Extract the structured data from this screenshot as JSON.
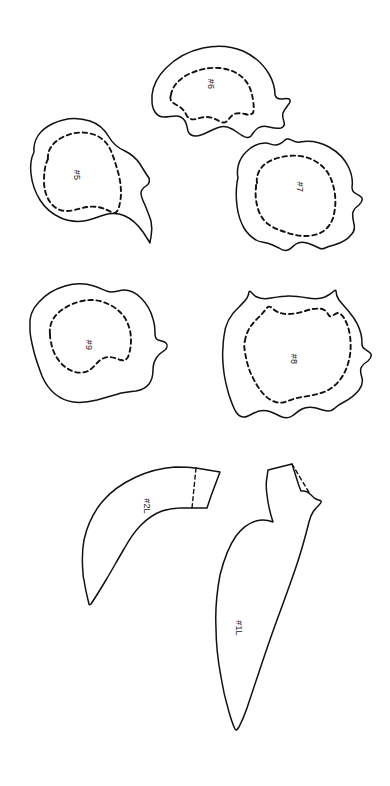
{
  "document": {
    "title": "Sewing Pattern Piece Layout Sheet",
    "kind": "pattern-sheet",
    "background_color": "#ffffff",
    "line_color": "#111111",
    "width": 390,
    "height": 786
  },
  "groups": [
    {
      "id": "group-top",
      "name": "upper-pieces-row",
      "labels": [
        "#5",
        "#6",
        "#7"
      ]
    },
    {
      "id": "group-middle",
      "name": "middle-pieces-row",
      "labels": [
        "#9",
        "#8"
      ]
    },
    {
      "id": "group-bottom",
      "name": "horn-pieces-row",
      "labels": [
        "#2L",
        "#1L"
      ]
    }
  ],
  "pieces": [
    {
      "id": "piece-5",
      "label": "#5",
      "label_x": 76,
      "label_y": 175,
      "label_rotation": 90,
      "has_seam_allowance": true,
      "has_fold_line": false,
      "outline": "M 34 152 C 33 140 40 130 52 124 C 64 118 78 117 90 121 C 99 124 105 130 109 137 C 113 144 118 148 125 151 C 131 154 136 158 140 164 C 143 169 146 174 149 178 C 150 181 149 184 146 186 C 143 188 141 190 141 193 C 141 197 143 201 145 205 C 147 210 149 215 151 221 C 152 226 152 232 151 237 C 150 241 150 243 150 243 C 150 243 147 238 143 232 C 138 225 132 219 125 216 C 118 213 111 213 104 215 C 97 217 91 220 84 221 C 76 222 68 221 61 218 C 52 214 45 208 40 200 C 35 192 32 183 31 174 C 30 165 31 158 34 152 Z",
      "seam": "M 48 159 C 47 150 53 142 63 137 C 73 132 85 131 95 135 C 103 138 108 144 111 151 C 114 158 116 165 118 172 C 120 179 121 186 121 193 C 121 198 120 203 119 207 C 118 210 117 212 115 213 C 112 213 110 211 107 210 C 101 207 94 206 87 207 C 80 208 74 211 67 211 C 60 211 54 208 50 202 C 46 196 44 189 44 181 C 44 172 45 165 48 159 Z"
    },
    {
      "id": "piece-6",
      "label": "#6",
      "label_x": 210,
      "label_y": 84,
      "label_rotation": 90,
      "has_seam_allowance": true,
      "has_fold_line": false,
      "outline": "M 152 95 C 153 86 158 76 166 68 C 176 58 189 51 203 48 C 217 45 231 46 243 51 C 254 56 263 64 269 74 C 273 81 275 88 275 95 C 276 98 278 99 281 99 C 284 99 287 98 289 99 C 291 100 290 103 288 105 C 286 108 284 110 283 113 C 282 116 283 119 284 122 C 285 125 284 127 281 128 C 277 129 273 128 269 127 C 265 126 261 126 258 128 C 255 130 253 133 251 136 C 249 138 246 138 243 136 C 239 134 236 131 232 129 C 228 127 224 126 220 127 C 216 128 212 130 208 132 C 204 134 200 136 196 136 C 192 136 189 134 188 131 C 187 127 187 124 185 121 C 183 118 180 116 176 116 C 172 116 168 117 164 117 C 160 117 157 115 155 112 C 153 109 152 105 152 101 C 152 98 152 96 152 95 Z",
      "seam": "M 171 95 C 172 87 178 80 187 75 C 197 70 208 67 219 68 C 230 69 239 73 245 80 C 250 86 252 93 253 100 C 254 106 254 110 253 113 C 251 115 248 115 245 114 C 241 113 237 113 234 114 C 231 116 229 119 227 121 C 225 123 222 123 219 121 C 215 119 211 117 207 117 C 203 117 199 118 196 119 C 192 120 189 119 187 116 C 185 112 183 109 180 107 C 177 105 174 104 172 102 C 170 100 170 97 171 95 Z"
    },
    {
      "id": "piece-7",
      "label": "#7",
      "label_x": 299,
      "label_y": 187,
      "label_rotation": 90,
      "has_seam_allowance": true,
      "has_fold_line": false,
      "outline": "M 238 178 C 236 169 239 159 246 152 C 252 146 259 143 265 143 C 269 143 272 145 275 145 C 279 145 282 143 285 140 C 289 136 294 144 300 142 C 310 140 320 142 329 147 C 338 152 345 159 349 168 C 352 175 353 181 352 187 C 352 190 353 192 355 193 C 358 195 361 196 362 198 C 363 201 361 203 359 205 C 356 207 354 209 353 212 C 352 216 353 220 354 224 C 355 228 354 232 351 235 C 347 240 341 243 334 245 C 330 246 327 247 325 248 C 323 249 321 249 319 248 C 315 246 311 244 307 243 C 303 242 299 242 296 244 C 293 246 291 249 288 250 C 285 251 282 250 279 248 C 275 246 271 244 267 243 C 263 242 259 242 256 240 C 251 237 247 233 244 228 C 240 221 238 214 237 206 C 236 198 236 190 237 183 C 237 180 238 179 238 178 Z",
      "seam": "M 257 183 C 256 176 259 169 265 164 C 272 159 280 157 288 156 C 296 155 304 156 311 159 C 318 162 324 167 328 173 C 332 180 334 187 335 195 C 336 203 335 211 333 218 C 331 224 327 229 322 232 C 317 235 311 236 305 236 C 298 236 291 234 285 232 C 279 230 273 228 268 224 C 263 220 260 215 258 209 C 256 202 255 195 256 188 C 256 185 256 184 257 183 Z"
    },
    {
      "id": "piece-9",
      "label": "#9",
      "label_x": 88,
      "label_y": 345,
      "label_rotation": 90,
      "has_seam_allowance": true,
      "has_fold_line": false,
      "outline": "M 30 327 C 29 318 32 309 39 302 C 46 294 55 289 65 286 C 75 283 85 283 94 286 C 101 288 106 292 111 292 C 116 292 120 290 124 290 C 130 290 136 293 141 298 C 147 304 151 311 153 319 C 155 325 155 330 155 334 C 155 337 156 339 158 340 C 161 341 164 341 166 343 C 168 345 167 348 165 350 C 162 352 159 354 157 357 C 154 361 153 365 153 370 C 153 375 152 380 149 384 C 146 388 141 390 136 391 C 130 392 124 392 118 394 C 111 396 104 398 97 400 C 89 402 81 403 73 402 C 66 401 60 398 55 394 C 49 389 45 383 42 376 C 39 368 36 360 34 352 C 32 344 30 336 30 330 C 30 328 30 327 30 327 Z",
      "seam": "M 50 334 C 49 326 52 319 58 313 C 65 307 73 303 82 301 C 91 299 100 300 108 304 C 115 307 121 312 125 318 C 129 325 131 332 131 340 C 131 346 130 352 128 357 C 126 360 124 361 121 360 C 117 359 113 357 109 357 C 105 357 101 359 98 362 C 95 365 92 369 88 371 C 84 373 79 373 75 372 C 69 370 64 367 60 362 C 55 356 52 349 51 342 C 50 338 50 336 50 334 Z"
    },
    {
      "id": "piece-8",
      "label": "#8",
      "label_x": 293,
      "label_y": 359,
      "label_rotation": 90,
      "has_seam_allowance": true,
      "has_fold_line": false,
      "outline": "M 224 336 C 225 325 230 315 239 307 C 242 304 245 301 247 298 C 248 296 249 294 249 292 C 249 291 250 291 251 292 C 253 294 254 296 257 297 C 261 299 266 299 271 298 C 277 297 283 296 289 296 C 296 296 302 297 308 298 C 314 299 320 299 325 297 C 329 295 332 293 334 291 C 335 290 336 290 336 291 C 336 294 337 297 339 300 C 342 304 346 308 350 313 C 355 319 359 326 361 334 C 362 338 362 341 362 344 C 362 346 363 348 365 349 C 367 351 370 352 371 354 C 372 357 370 359 368 361 C 365 363 362 365 361 368 C 360 371 361 375 362 378 C 363 382 362 386 359 390 C 355 395 350 399 344 402 C 340 404 337 406 335 408 C 333 410 331 411 328 411 C 324 411 320 409 316 408 C 311 407 306 407 302 409 C 298 411 295 414 292 416 C 289 418 285 418 282 417 C 277 415 273 412 268 411 C 263 410 258 411 254 413 C 250 415 247 417 244 417 C 241 417 238 415 236 412 C 233 407 231 401 229 395 C 227 388 225 381 224 373 C 223 365 222 356 223 348 C 223 341 224 337 224 336 Z",
      "seam": "M 245 341 C 246 333 250 326 256 320 C 260 316 263 313 266 309 C 268 306 270 306 272 308 C 276 312 281 314 287 314 C 293 314 299 313 305 311 C 311 309 317 308 322 309 C 325 310 327 312 328 314 C 329 316 330 317 332 316 C 334 315 336 313 338 313 C 340 313 342 315 344 318 C 347 323 349 329 350 336 C 351 344 351 352 349 360 C 347 368 344 375 339 381 C 334 387 328 391 321 393 C 315 395 308 396 302 397 C 296 398 290 400 285 402 C 281 403 277 403 273 401 C 268 399 264 395 261 391 C 257 386 254 380 251 374 C 248 367 246 359 245 352 C 244 347 244 343 245 341 Z"
    },
    {
      "id": "piece-2L",
      "label": "#2L",
      "label_x": 146,
      "label_y": 506,
      "label_rotation": 90,
      "has_seam_allowance": false,
      "has_fold_line": true,
      "outline": "M 83 573 C 82 562 82 551 84 540 C 87 526 93 513 102 502 C 111 491 123 483 136 477 C 149 471 162 468 175 467 C 182 467 189 467 194 468 L 196 468 L 220 472 L 211 496 L 208 505 L 207 508 L 192 508 L 181 508 C 174 508 168 509 162 511 C 154 514 147 519 141 525 C 134 532 129 540 124 549 C 118 559 112 570 106 580 C 100 590 95 598 91 604 C 90 605 89 605 89 604 C 87 596 85 587 84 580 C 83 577 83 575 83 573 Z",
      "fold": "M 196 468 L 192 508"
    },
    {
      "id": "piece-1L",
      "label": "#1L",
      "label_x": 238,
      "label_y": 628,
      "label_rotation": 90,
      "has_seam_allowance": false,
      "has_fold_line": true,
      "outline": "M 273 522 C 270 513 268 504 267 495 C 266 488 266 482 267 477 L 268 470 L 292 464 L 299 486 L 301 491 L 304 491 C 306 491 308 492 310 494 C 312 496 314 498 316 499 C 318 500 320 500 321 501 C 322 502 321 503 319 505 C 317 507 315 509 313 512 C 311 515 310 518 309 522 C 306 534 302 549 297 564 C 291 582 284 601 277 620 C 270 639 264 657 259 672 C 254 687 250 699 247 708 C 244 717 241 723 239 727 C 237 730 236 731 235 729 C 233 725 231 719 229 712 C 226 702 223 690 221 677 C 218 661 216 644 216 628 C 215 609 217 591 220 575 C 224 559 229 546 236 536 C 242 528 249 523 256 521 C 262 519 268 520 273 522 Z",
      "fold": "M 292 464 L 310 494"
    }
  ]
}
